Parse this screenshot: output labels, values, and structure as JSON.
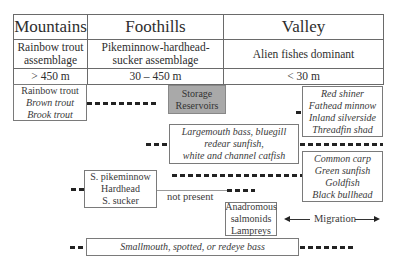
{
  "zones": [
    {
      "name": "Mountains",
      "assemblage": [
        "Rainbow trout",
        "assemblage"
      ],
      "elevation": "> 450 m"
    },
    {
      "name": "Foothills",
      "assemblage": [
        "Pikeminnow-hardhead-",
        "sucker assemblage"
      ],
      "elevation": "30 – 450 m"
    },
    {
      "name": "Valley",
      "assemblage": [
        "Alien fishes dominant"
      ],
      "elevation": "< 30 m"
    }
  ],
  "boxes": {
    "trout": {
      "lines": [
        {
          "text": "Rainbow trout",
          "italic": false
        },
        {
          "text": "Brown trout",
          "italic": true
        },
        {
          "text": "Brook trout",
          "italic": true
        }
      ]
    },
    "storage": {
      "lines": [
        "Storage",
        "Reservoirs"
      ],
      "fill": "#a9a9a9"
    },
    "valley_minnows": {
      "lines": [
        "Red shiner",
        "Fathead minnow",
        "Inland silverside",
        "Threadfin shad"
      ]
    },
    "largemouth": {
      "lines": [
        "Largemouth bass, bluegill",
        "redear sunfish,",
        "white and channel catfish"
      ]
    },
    "carp": {
      "lines": [
        "Common carp",
        "Green sunfish",
        "Goldfish",
        "Black bullhead"
      ]
    },
    "native_foothill": {
      "lines": [
        "S. pikeminnow",
        "Hardhead",
        "S. sucker"
      ]
    },
    "anadromous": {
      "lines": [
        "Anadromous",
        "salmonids",
        "Lampreys"
      ]
    },
    "bass": {
      "lines": [
        "Smallmouth, spotted, or redeye bass"
      ]
    }
  },
  "labels": {
    "not_present": "not present",
    "migration": "Migration"
  }
}
